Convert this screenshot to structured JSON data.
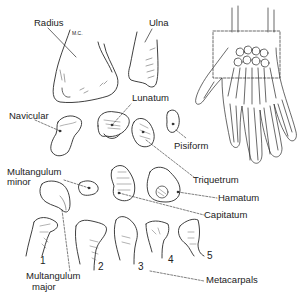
{
  "diagram": {
    "type": "anatomical-illustration",
    "labels": {
      "radius": "Radius",
      "radius_note": "M.C.",
      "ulna": "Ulna",
      "lunatum": "Lunatum",
      "navicular": "Navicular",
      "pisiform": "Pisiform",
      "multangulum_minor_1": "Multangulum",
      "multangulum_minor_2": "minor",
      "triquetrum": "Triquetrum",
      "hamatum": "Hamatum",
      "capitatum": "Capitatum",
      "multangulum_major_1": "Multangulum",
      "multangulum_major_2": "major",
      "metacarpals": "Metacarpals"
    },
    "metacarpal_numbers": [
      "1",
      "2",
      "3",
      "4",
      "5"
    ],
    "inset": {
      "subject": "Dorsal view of right hand skeleton",
      "highlight": "dashed rectangle around carpal region"
    },
    "colors": {
      "line": "#2a2a2a",
      "hatch": "#555555",
      "background": "#ffffff"
    }
  }
}
